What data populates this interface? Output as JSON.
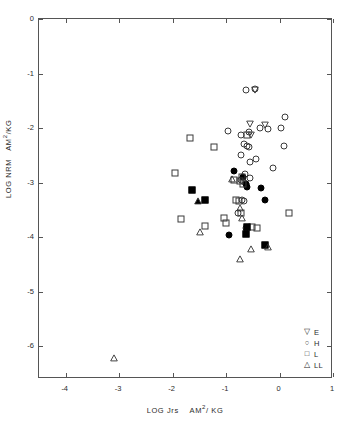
{
  "figure": {
    "panel_label": "(a) Chondrites",
    "background": "#ffffff",
    "axis_color": "#555555",
    "marker_color": "#000000"
  },
  "axes": {
    "y_title_part1": "LOG NRM",
    "y_title_part2": "AM",
    "y_title_sup": "2",
    "y_title_part3": "/KG",
    "x_title_part1": "LOG Jrs",
    "x_title_part2": "AM",
    "x_title_sup": "2",
    "x_title_part3": "/ KG",
    "y_ticks": [
      "0",
      "-1",
      "-2",
      "-3",
      "-4",
      "-5",
      "-6"
    ],
    "y_tick_values": [
      0,
      -1,
      -2,
      -3,
      -4,
      -5,
      -6
    ],
    "x_ticks": [
      "-4",
      "-3",
      "-2",
      "-1",
      "0",
      "1"
    ],
    "x_tick_values": [
      -4,
      -3,
      -2,
      -1,
      0,
      1
    ]
  },
  "legend": {
    "position": "bottom-right",
    "entries": [
      {
        "symbol": "triangle-down-open",
        "glyph": "▽",
        "label": "E"
      },
      {
        "symbol": "circle-open",
        "glyph": "○",
        "label": "H"
      },
      {
        "symbol": "square-open",
        "glyph": "□",
        "label": "L"
      },
      {
        "symbol": "triangle-up-open",
        "glyph": "△",
        "label": "LL"
      }
    ]
  },
  "chart_data": {
    "type": "scatter",
    "title": "(a) Chondrites",
    "xlabel": "LOG Jrs   AM2/KG",
    "ylabel": "LOG NRM   AM2/KG",
    "xlim": [
      -4.5,
      1.0
    ],
    "ylim": [
      -6.6,
      0.0
    ],
    "grid": false,
    "legend_position": "bottom-right",
    "series": [
      {
        "name": "E",
        "marker": "triangle-down-open",
        "points": [
          [
            -0.46,
            -1.3
          ],
          [
            -0.56,
            -1.92
          ],
          [
            -0.27,
            -1.95
          ],
          [
            -0.53,
            -2.12
          ]
        ]
      },
      {
        "name": "H",
        "marker": "circle-open",
        "points": [
          [
            -0.62,
            -1.31
          ],
          [
            -0.45,
            -1.29
          ],
          [
            0.11,
            -1.8
          ],
          [
            -0.97,
            -2.05
          ],
          [
            -0.36,
            -1.99
          ],
          [
            -0.22,
            -2.02
          ],
          [
            0.02,
            -2.0
          ],
          [
            -0.58,
            -2.07
          ],
          [
            -0.73,
            -2.12
          ],
          [
            -0.67,
            -2.29
          ],
          [
            -0.6,
            -2.32
          ],
          [
            -0.57,
            -2.35
          ],
          [
            0.09,
            -2.33
          ],
          [
            -0.72,
            -2.5
          ],
          [
            -0.44,
            -2.57
          ],
          [
            -0.12,
            -2.73
          ],
          [
            -0.56,
            -2.63
          ],
          [
            -0.64,
            -2.84
          ],
          [
            -0.55,
            -2.92
          ],
          [
            -0.73,
            -2.96
          ],
          [
            -0.68,
            -2.97
          ],
          [
            -0.62,
            -3.02
          ],
          [
            -0.7,
            -3.32
          ],
          [
            -0.66,
            -3.33
          ],
          [
            -0.78,
            -3.56
          ],
          [
            -0.62,
            -3.83
          ]
        ]
      },
      {
        "name": "H-filled",
        "marker": "circle-filled",
        "points": [
          [
            -0.86,
            -2.79
          ],
          [
            -0.69,
            -2.9
          ],
          [
            -0.63,
            -3.02
          ],
          [
            -0.6,
            -3.08
          ],
          [
            -0.34,
            -3.1
          ],
          [
            -0.28,
            -3.31
          ],
          [
            -0.95,
            -3.96
          ]
        ]
      },
      {
        "name": "L",
        "marker": "square-open",
        "points": [
          [
            -1.68,
            -2.18
          ],
          [
            -1.23,
            -2.35
          ],
          [
            -0.61,
            -2.12
          ],
          [
            -0.86,
            -2.95
          ],
          [
            -1.95,
            -2.82
          ],
          [
            -0.7,
            -2.9
          ],
          [
            -0.74,
            -2.97
          ],
          [
            -0.68,
            -3.03
          ],
          [
            -0.82,
            -3.32
          ],
          [
            -0.76,
            -3.34
          ],
          [
            -0.73,
            -3.56
          ],
          [
            -1.84,
            -3.67
          ],
          [
            -1.04,
            -3.65
          ],
          [
            -1.0,
            -3.74
          ],
          [
            -1.4,
            -3.8
          ],
          [
            -0.52,
            -3.82
          ],
          [
            -0.43,
            -3.83
          ],
          [
            0.17,
            -3.56
          ]
        ]
      },
      {
        "name": "L-filled",
        "marker": "square-filled",
        "points": [
          [
            -1.63,
            -3.13
          ],
          [
            -1.39,
            -3.32
          ],
          [
            -0.6,
            -3.82
          ],
          [
            -0.63,
            -3.95
          ],
          [
            -0.28,
            -4.14
          ]
        ]
      },
      {
        "name": "LL",
        "marker": "triangle-up-open",
        "points": [
          [
            -0.89,
            -2.94
          ],
          [
            -0.74,
            -3.47
          ],
          [
            -0.7,
            -3.64
          ],
          [
            -1.48,
            -3.9
          ],
          [
            -0.53,
            -4.22
          ],
          [
            -0.21,
            -4.18
          ],
          [
            -0.74,
            -4.4
          ],
          [
            -3.1,
            -6.22
          ]
        ]
      },
      {
        "name": "LL-filled",
        "marker": "triangle-up-filled",
        "points": [
          [
            -1.52,
            -3.33
          ]
        ]
      }
    ]
  }
}
